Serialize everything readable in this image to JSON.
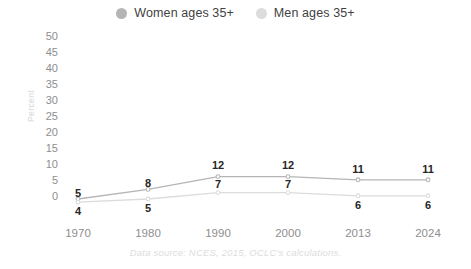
{
  "chart_data": {
    "type": "line",
    "title": "",
    "subtitle": "",
    "xlabel": "",
    "ylabel": "Percent",
    "categories": [
      "1970",
      "1980",
      "1990",
      "2000",
      "2013",
      "2024"
    ],
    "x": [
      1970,
      1980,
      1990,
      2000,
      2013,
      2024
    ],
    "ylim": [
      0,
      50
    ],
    "yticks": [
      "0",
      "5",
      "10",
      "15",
      "20",
      "25",
      "30",
      "35",
      "40",
      "45",
      "50"
    ],
    "grid": false,
    "legend_position": "top-center",
    "series": [
      {
        "name": "Women ages 35+",
        "color": "#b5b5b5",
        "values": [
          5,
          8,
          12,
          12,
          11,
          11
        ],
        "labels": [
          "5",
          "8",
          "12",
          "12",
          "11",
          "11"
        ]
      },
      {
        "name": "Men ages 35+",
        "color": "#dcdcdc",
        "values": [
          4,
          5,
          7,
          7,
          6,
          6
        ],
        "labels": [
          "4",
          "5",
          "7",
          "7",
          "6",
          "6"
        ]
      }
    ],
    "annotations": [
      "Data source: NCES, 2015, OCLC's calculations."
    ]
  },
  "legend": {
    "items": [
      {
        "label": "Women ages 35+",
        "dot": "legend-dot-women",
        "color": "#b5b5b5"
      },
      {
        "label": "Men ages 35+",
        "dot": "legend-dot-men",
        "color": "#dcdcdc"
      }
    ]
  },
  "axes": {
    "y_title": "Percent",
    "y_ticks": [
      "50",
      "45",
      "40",
      "35",
      "30",
      "25",
      "20",
      "15",
      "10",
      "5",
      "0"
    ],
    "x_ticks": [
      "1970",
      "1980",
      "1990",
      "2000",
      "2013",
      "2024"
    ]
  },
  "footer": {
    "source": "Data source: NCES, 2015, OCLC's calculations."
  },
  "colors": {
    "women": "#b5b5b5",
    "men": "#dcdcdc",
    "tick_text": "#8e8e8e",
    "value_text": "#262626",
    "source_text": "#dddddd",
    "background": "#ffffff"
  }
}
